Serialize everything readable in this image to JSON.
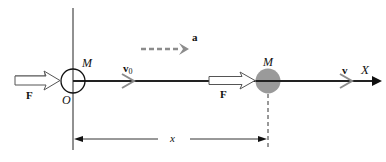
{
  "diagram": {
    "axis_label": "X",
    "origin_label": "O",
    "initial_body": {
      "label": "M",
      "force_label": "F",
      "velocity_label": "v",
      "velocity_subscript": "0"
    },
    "final_body": {
      "label": "M",
      "force_label": "F",
      "velocity_label": "v"
    },
    "acceleration_label": "a",
    "displacement_label": "x",
    "colors": {
      "axis": "#222222",
      "body_fill": "#9a9a9a",
      "vector_gray": "#8c8c8c",
      "line": "#000000"
    }
  }
}
